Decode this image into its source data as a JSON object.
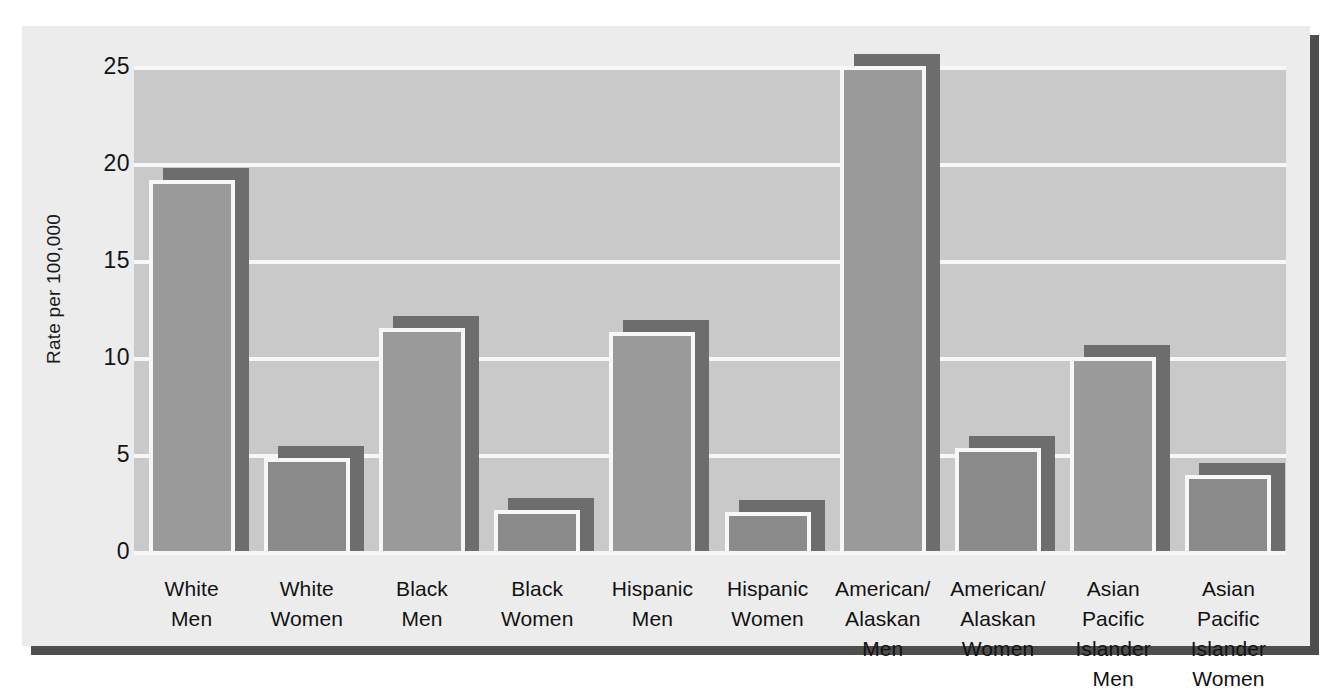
{
  "chart_data": {
    "type": "bar",
    "title": "",
    "subtitle": "",
    "xlabel": "",
    "ylabel": "Rate per 100,000",
    "ylim": [
      0,
      25
    ],
    "ytick_values": [
      0,
      5,
      10,
      15,
      20,
      25
    ],
    "ytick_labels": [
      "0",
      "5",
      "10",
      "15",
      "20",
      "25"
    ],
    "grid": true,
    "legend": "none",
    "categories": [
      "White Men",
      "White Women",
      "Black Men",
      "Black Women",
      "Hispanic Men",
      "Hispanic Women",
      "American/ Alaskan Men",
      "American/ Alaskan Women",
      "Asian Pacific Islander Men",
      "Asian Pacific Islander Women"
    ],
    "category_lines": [
      [
        "White",
        "Men"
      ],
      [
        "White",
        "Women"
      ],
      [
        "Black",
        "Men"
      ],
      [
        "Black",
        "Women"
      ],
      [
        "Hispanic",
        "Men"
      ],
      [
        "Hispanic",
        "Women"
      ],
      [
        "American/",
        "Alaskan",
        "Men"
      ],
      [
        "American/",
        "Alaskan",
        "Women"
      ],
      [
        "Asian Pacific",
        "Islander",
        "Men"
      ],
      [
        "Asian Pacific",
        "Islander",
        "Women"
      ]
    ],
    "values": [
      19.1,
      4.8,
      11.5,
      2.1,
      11.3,
      2.0,
      25.0,
      5.3,
      10.0,
      3.9
    ],
    "colors": {
      "bar_fill": "#9a9a9a",
      "bar_fill_dark": "#8a8a8a",
      "bar_outline": "#f7f7f7",
      "bar_shadow": "#6d6d6d",
      "plot_background": "#c9c9c9",
      "panel_background": "#ececec",
      "gridline": "#f7f7f7",
      "panel_shadow": "#4e4e4e",
      "text": "#121212"
    }
  }
}
